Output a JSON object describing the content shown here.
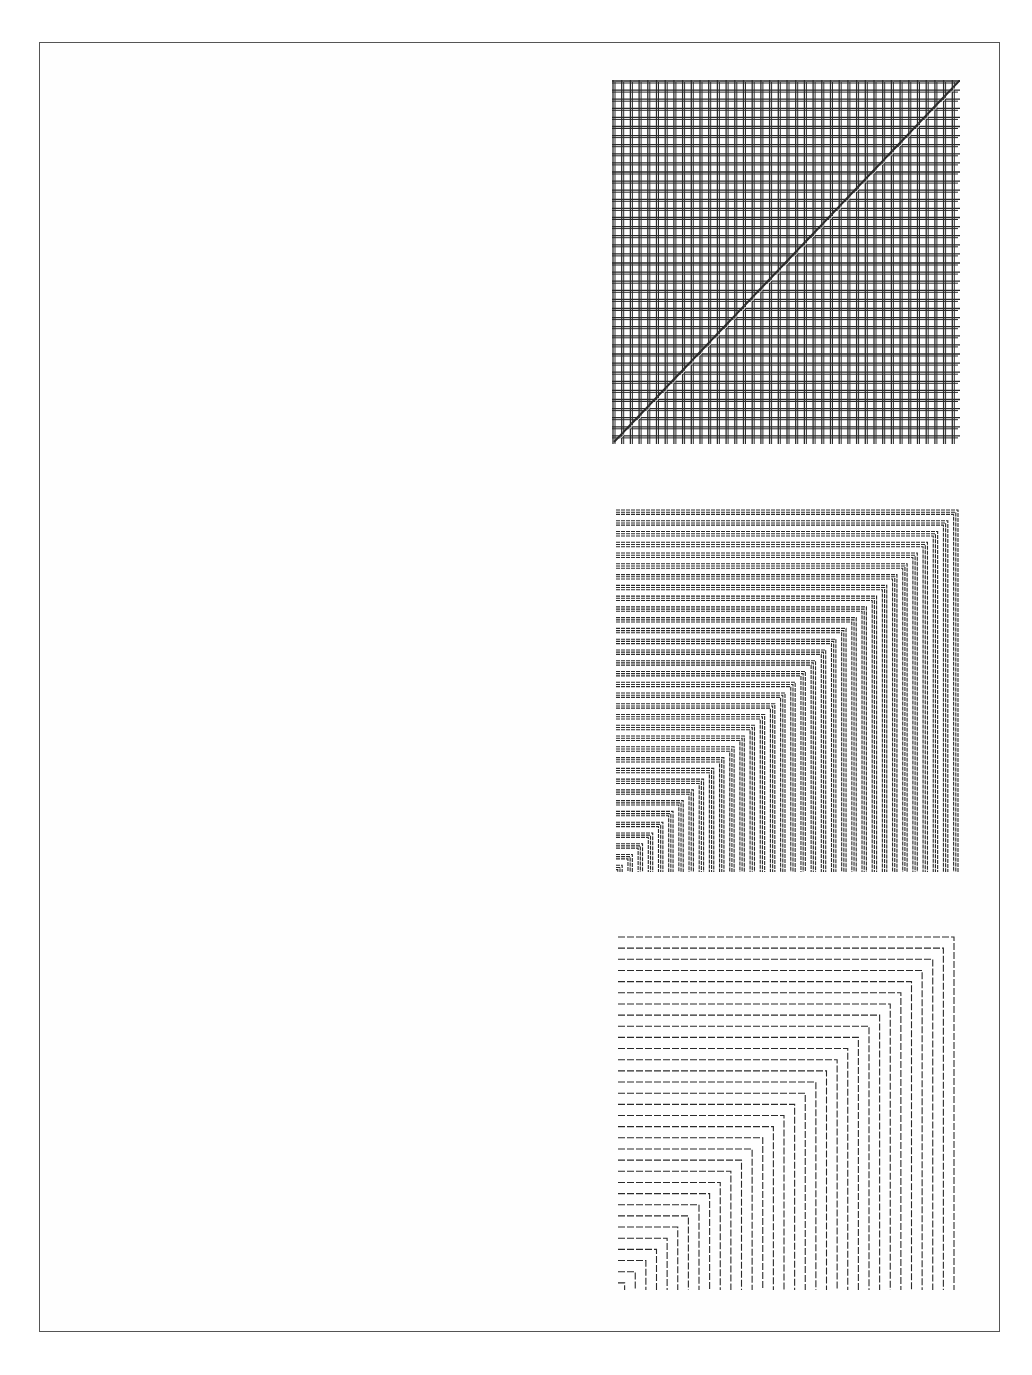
{
  "page": {
    "background": "#ffffff",
    "frame_color": "#555555",
    "ink_color": "#2a2a2a"
  },
  "figures": [
    {
      "id": "grid-with-diagonal",
      "type": "crosshatch-grid",
      "x": 612,
      "y": 80,
      "width": 348,
      "height": 364,
      "cols": 40,
      "rows": 40,
      "line_doubling": 2,
      "diagonal": "bottom-left-to-top-right"
    },
    {
      "id": "nested-corners-dense",
      "type": "nested-l-shapes",
      "x": 616,
      "y": 506,
      "width": 346,
      "height": 366,
      "count": 34,
      "strands": 3,
      "dash": "4,1"
    },
    {
      "id": "nested-corners-sparse",
      "type": "nested-l-shapes",
      "x": 618,
      "y": 933,
      "width": 340,
      "height": 357,
      "count": 32,
      "strands": 1,
      "dash": "7,2"
    }
  ]
}
